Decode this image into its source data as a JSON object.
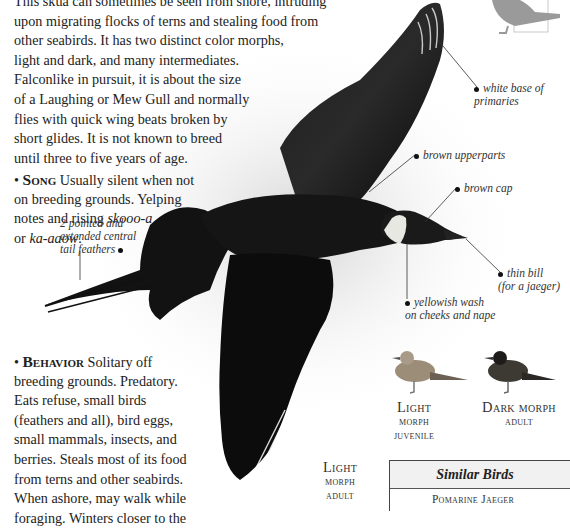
{
  "intro": {
    "lines": [
      "This skua can sometimes be seen from shore, intruding",
      "upon migrating flocks of terns and stealing food from",
      "other seabirds. It has two distinct color morphs,",
      "light and dark, and many intermediates.",
      "Falconlike in pursuit, it is about the size",
      "of a Laughing or Mew Gull and normally",
      "flies with quick wing beats broken by",
      "short glides. It is not known to breed",
      "until three to five years of age."
    ]
  },
  "song": {
    "heading": "Song",
    "line1": "Usually silent when not",
    "line2": "on breeding grounds. Yelping",
    "line3_prefix": "notes and rising ",
    "call1": "skooo-a",
    "line4_prefix": "or ",
    "call2": "ka-aaow",
    "line4_suffix": "."
  },
  "behavior": {
    "heading": "Behavior",
    "line1": "Solitary off",
    "lines": [
      "breeding grounds. Predatory.",
      "Eats refuse, small birds",
      "(feathers and all), bird eggs,",
      "small mammals, insects, and",
      "berries. Steals most of its food",
      "from terns and other seabirds.",
      "When ashore, may walk while",
      "foraging. Winters closer to the"
    ]
  },
  "callouts": {
    "tail": [
      "2 pointed and",
      "extended central",
      "tail feathers"
    ],
    "primaries": [
      "white base of",
      "primaries"
    ],
    "upperparts": "brown upperparts",
    "cap": "brown cap",
    "bill": [
      "thin bill",
      "(for a jaeger)"
    ],
    "wash": [
      "yellowish wash",
      "on cheeks and nape"
    ]
  },
  "captions": {
    "main": [
      "Light",
      "morph",
      "adult"
    ],
    "juvenile": [
      "Light",
      "morph",
      "juvenile"
    ],
    "dark": [
      "Dark morph",
      "adult"
    ]
  },
  "similar_birds": {
    "title": "Similar Birds",
    "items": [
      "Pomarine Jaeger"
    ]
  },
  "colors": {
    "bird_dark": "#0d0d0d",
    "silhouette": "#9a9a9a",
    "box_header": "#f1f1f1"
  }
}
